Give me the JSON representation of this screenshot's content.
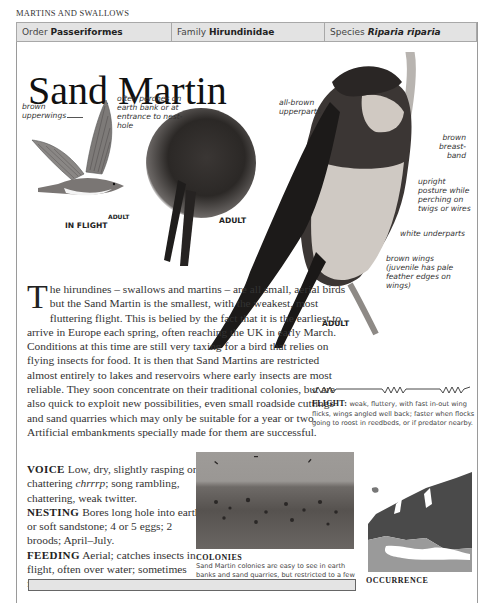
{
  "section_heading": "MARTINS AND SWALLOWS",
  "taxonomy": {
    "order_label": "Order",
    "order_value": "Passeriformes",
    "family_label": "Family",
    "family_value": "Hirundinidae",
    "species_label": "Species",
    "species_value": "Riparia riparia"
  },
  "title": "Sand Martin",
  "illustrations": {
    "flight": {
      "annotation_upperwings": "brown upperwings",
      "label_adult": "ADULT",
      "label_view": "IN FLIGHT"
    },
    "perched_photo": {
      "annotation": "often perches on earth bank or at entrance to nest-hole",
      "label_adult": "ADULT"
    },
    "main_photo": {
      "annotation_upperparts": "all-brown upperparts",
      "annotation_breastband": "brown breast-band",
      "annotation_posture": "upright posture while perching on twigs or wires",
      "annotation_underparts": "white underparts",
      "annotation_wings": "brown wings (juvenile has pale feather edges on wings)",
      "label_adult": "ADULT"
    }
  },
  "body": {
    "dropcap": "T",
    "intro": "he hirundines – swallows and martins – are all small, aerial birds but the Sand Martin is the smallest, with the weakest, most fluttering flight. This is belied by the fact that it is the earliest to arrive in Europe each spring, often reaching the UK in early March. Conditions at this time are still very taxing for a bird that relies on flying insects for food. It is then that Sand Martins are restricted almost entirely to lakes and reservoirs where early insects are most reliable. They soon concentrate on their traditional colonies, but are also quick to exploit new possibilities, even small roadside cuttings and sand quarries which may only be suitable for a year or two. Artificial embankments specially made for them are successful.",
    "voice_label": "VOICE",
    "voice_text": " Low, dry, slightly rasping or chattering ",
    "voice_call": "chrrrp",
    "voice_text2": "; song rambling, chattering, weak twitter.",
    "nesting_label": "NESTING",
    "nesting_text": " Bores long hole into earth or soft sandstone; 4 or 5 eggs; 2 broods; April–July.",
    "feeding_label": "FEEDING",
    "feeding_text": " Aerial; catches insects in flight, often over water; sometimes feeds on bare ground."
  },
  "flight_pattern": {
    "label": "FLIGHT:",
    "text": " weak, fluttery, with fast in-out wing flicks, wings angled well back; faster when flocks going to roost in reedbeds, or if predator nearby."
  },
  "colonies": {
    "title": "COLONIES",
    "caption": "Sand Martin colonies are easy to see in earth banks and sand quarries, but restricted to a few localities."
  },
  "occurrence": {
    "title": "OCCURRENCE"
  },
  "colors": {
    "taxbar_bg": "#e3e3e3",
    "border": "#9a9a9a",
    "map_range": "#4a4a4a",
    "map_land": "#8c8c8c"
  }
}
